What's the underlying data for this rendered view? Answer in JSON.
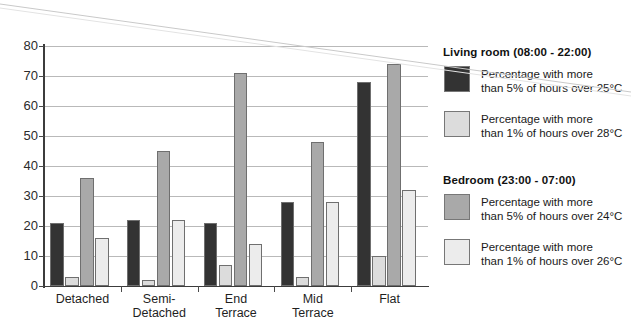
{
  "chart_data": {
    "type": "bar",
    "title": "",
    "subtitle": "",
    "xlabel": "",
    "ylabel": "",
    "ylim": [
      0,
      80
    ],
    "yticks": [
      0,
      10,
      20,
      30,
      40,
      50,
      60,
      70,
      80
    ],
    "grid": true,
    "legend_position": "right",
    "categories": [
      "Detached",
      "Semi-\nDetached",
      "End\nTerrace",
      "Mid\nTerrace",
      "Flat"
    ],
    "category_lines": [
      [
        "Detached"
      ],
      [
        "Semi-",
        "Detached"
      ],
      [
        "End",
        "Terrace"
      ],
      [
        "Mid",
        "Terrace"
      ],
      [
        "Flat"
      ]
    ],
    "series": [
      {
        "name": "Living room (08:00 - 22:00) — Percentage with more than 5% of hours over 25°C",
        "short": "LR >5% hrs over 25°C",
        "color": "#333333",
        "values": [
          21,
          22,
          21,
          28,
          68
        ]
      },
      {
        "name": "Living room (08:00 - 22:00) — Percentage with more than 1% of hours over 28°C",
        "short": "LR >1% hrs over 28°C",
        "color": "#dcdcdc",
        "values": [
          3,
          2,
          7,
          3,
          10
        ]
      },
      {
        "name": "Bedroom (23:00 - 07:00) — Percentage with more than 5% of hours over 24°C",
        "short": "BR >5% hrs over 24°C",
        "color": "#a9a9a9",
        "values": [
          36,
          45,
          71,
          48,
          74
        ]
      },
      {
        "name": "Bedroom (23:00 - 07:00) — Percentage with more than 1% of hours over 26°C",
        "short": "BR >1% hrs over 26°C",
        "color": "#ececec",
        "values": [
          16,
          22,
          14,
          28,
          32
        ]
      }
    ]
  },
  "legend": {
    "sections": [
      {
        "title": "Living room (08:00 - 22:00)",
        "entries": [
          {
            "color": "#333333",
            "line1": "Percentage with more",
            "line2": "than 5% of hours over 25°C"
          },
          {
            "color": "#dcdcdc",
            "line1": "Percentage with more",
            "line2": "than 1% of hours over 28°C"
          }
        ]
      },
      {
        "title": "Bedroom (23:00 - 07:00)",
        "entries": [
          {
            "color": "#a9a9a9",
            "line1": "Percentage with more",
            "line2": "than 5% of hours over 24°C"
          },
          {
            "color": "#ececec",
            "line1": "Percentage with more",
            "line2": "than 1% of hours over 26°C"
          }
        ]
      }
    ]
  },
  "axis": {
    "y_tick_labels": [
      "0",
      "10",
      "20",
      "30",
      "40",
      "50",
      "60",
      "70",
      "80"
    ]
  }
}
